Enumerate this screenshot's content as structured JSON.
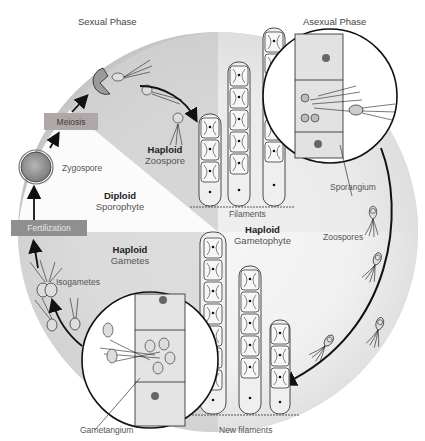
{
  "diagram": {
    "phases": {
      "sexual": "Sexual Phase",
      "asexual": "Asexual Phase"
    },
    "process_boxes": {
      "meiosis": "Meiosis",
      "fertilization": "Fertilization"
    },
    "structures": {
      "zygospore": "Zygospore",
      "filaments": "Filaments",
      "sporangium": "Sporangium",
      "zoospores": "Zoospores",
      "isogametes": "Isogametes",
      "gametangium": "Gametangium",
      "new_filaments": "New filaments"
    },
    "stages": {
      "diploid_sporophyte": {
        "ploidy": "Diploid",
        "name": "Sporophyte"
      },
      "haploid_zoospore": {
        "ploidy": "Haploid",
        "name": "Zoospore"
      },
      "haploid_gametes": {
        "ploidy": "Haploid",
        "name": "Gametes"
      },
      "haploid_gametophyte": {
        "ploidy": "Haploid",
        "name": "Gametophyte"
      }
    },
    "colors": {
      "background_disc_light": "#f4f4f4",
      "background_disc_dark": "#c8c8c8",
      "meiosis_box": "#b0a8a8",
      "fertilization_box": "#8f8f8f",
      "outline": "#1a1a1a"
    }
  }
}
